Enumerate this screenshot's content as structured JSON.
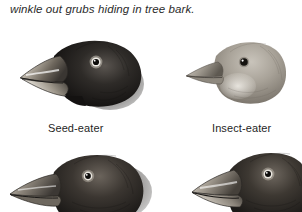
{
  "figure": {
    "caption": "winkle out grubs hiding in tree bark.",
    "background_color": "#ffffff",
    "text_color": "#2b2b2b",
    "label_color": "#1f1f1f"
  },
  "labels": {
    "seed_eater": "Seed-eater",
    "insect_eater": "Insect-eater"
  },
  "birds": [
    {
      "id": "seed-eater",
      "position": "top-left",
      "label": "Seed-eater",
      "beak": "large thick conical pale beak",
      "plumage_tone": "very dark / black",
      "facing": "left"
    },
    {
      "id": "insect-eater",
      "position": "top-right",
      "label": "Insect-eater",
      "beak": "slender pointed beak",
      "plumage_tone": "light gray / tan",
      "facing": "left"
    },
    {
      "id": "bottom-left-finch",
      "position": "bottom-left",
      "label": "",
      "beak": "medium slender pointed beak",
      "plumage_tone": "dark gray / black",
      "facing": "left"
    },
    {
      "id": "bottom-right-finch",
      "position": "bottom-right",
      "label": "",
      "beak": "broad conical beak",
      "plumage_tone": "dark gray / black",
      "facing": "left"
    }
  ]
}
